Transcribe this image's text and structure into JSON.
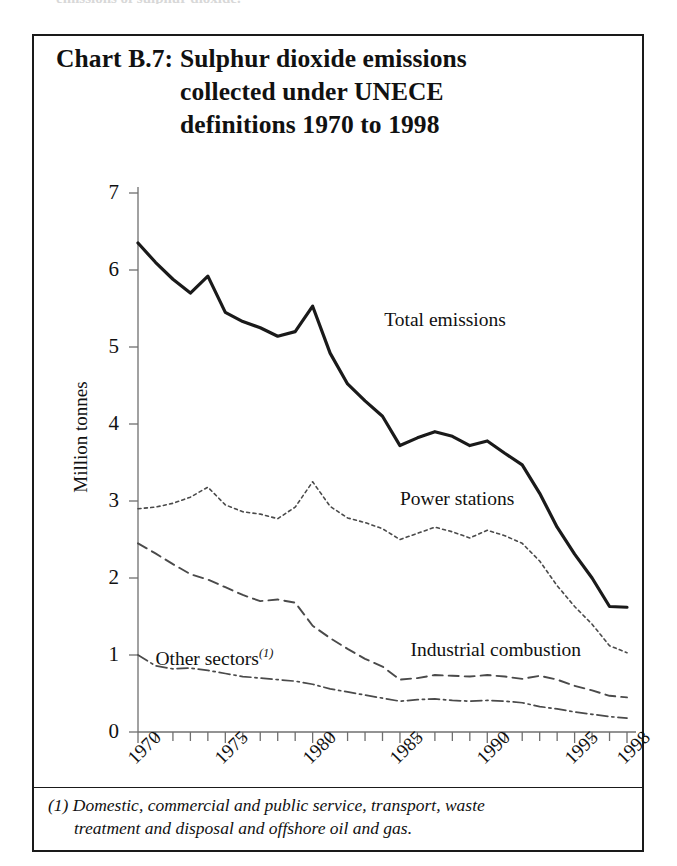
{
  "page": {
    "top_bleed_text": "emissions of sulphur dioxide."
  },
  "chart_box": {
    "title_label": "Chart B.7:",
    "title_lines": [
      "Sulphur dioxide emissions",
      "collected under UNECE",
      "definitions 1970 to 1998"
    ],
    "footnote_line1": "(1) Domestic, commercial and public service, transport, waste",
    "footnote_line2": "treatment and disposal and offshore oil and gas."
  },
  "colors": {
    "ink": "#1a1a1a",
    "axis": "#6f6f6f",
    "total_series": "#1a1a1a",
    "power_series": "#4a4a4a",
    "industrial_series": "#4a4a4a",
    "other_series": "#4a4a4a",
    "background": "#ffffff"
  },
  "chart_data": {
    "type": "line",
    "title": "Chart B.7: Sulphur dioxide emissions collected under UNECE definitions 1970 to 1998",
    "xlabel": "",
    "ylabel": "Million tonnes",
    "xlim": [
      1970,
      1998
    ],
    "ylim": [
      0,
      7
    ],
    "y_ticks": [
      0,
      1,
      2,
      3,
      4,
      5,
      6,
      7
    ],
    "y_tick_labels": [
      "0",
      "1",
      "2",
      "3",
      "4",
      "5",
      "6",
      "7"
    ],
    "x_ticks": [
      1970,
      1975,
      1980,
      1985,
      1990,
      1995,
      1998
    ],
    "x_tick_labels": [
      "1970",
      "1975",
      "1980",
      "1985",
      "1990",
      "1995",
      "1998"
    ],
    "x_minor_tick_every": 1,
    "grid": false,
    "legend": "inline-annotations",
    "x": [
      1970,
      1971,
      1972,
      1973,
      1974,
      1975,
      1976,
      1977,
      1978,
      1979,
      1980,
      1981,
      1982,
      1983,
      1984,
      1985,
      1986,
      1987,
      1988,
      1989,
      1990,
      1991,
      1992,
      1993,
      1994,
      1995,
      1996,
      1997,
      1998
    ],
    "series": [
      {
        "name": "Total emissions",
        "style": "solid",
        "width": 3.2,
        "label_x": 1984.1,
        "label_y": 5.35,
        "values": [
          6.35,
          6.1,
          5.88,
          5.7,
          5.92,
          5.45,
          5.33,
          5.25,
          5.14,
          5.2,
          5.53,
          4.92,
          4.52,
          4.3,
          4.1,
          3.72,
          3.82,
          3.9,
          3.84,
          3.72,
          3.78,
          3.62,
          3.47,
          3.1,
          2.66,
          2.31,
          2.0,
          1.63,
          1.62
        ]
      },
      {
        "name": "Power stations",
        "style": "dotted",
        "width": 1.6,
        "label_x": 1985.0,
        "label_y": 3.02,
        "values": [
          2.9,
          2.92,
          2.97,
          3.05,
          3.18,
          2.95,
          2.86,
          2.83,
          2.77,
          2.92,
          3.25,
          2.93,
          2.78,
          2.72,
          2.64,
          2.5,
          2.58,
          2.66,
          2.6,
          2.52,
          2.62,
          2.55,
          2.45,
          2.22,
          1.9,
          1.63,
          1.4,
          1.12,
          1.03
        ]
      },
      {
        "name": "Industrial combustion",
        "style": "dashed",
        "width": 1.9,
        "label_x": 1985.6,
        "label_y": 1.07,
        "values": [
          2.45,
          2.32,
          2.18,
          2.05,
          1.98,
          1.88,
          1.78,
          1.7,
          1.72,
          1.68,
          1.38,
          1.22,
          1.08,
          0.95,
          0.85,
          0.68,
          0.7,
          0.74,
          0.73,
          0.72,
          0.74,
          0.72,
          0.69,
          0.73,
          0.68,
          0.6,
          0.54,
          0.47,
          0.45
        ]
      },
      {
        "name": "Other sectors",
        "style": "dashdot",
        "width": 1.7,
        "superscript": "(1)",
        "label_x": 1971.0,
        "label_y": 1.02,
        "values": [
          1.0,
          0.86,
          0.82,
          0.83,
          0.8,
          0.76,
          0.72,
          0.7,
          0.68,
          0.66,
          0.62,
          0.56,
          0.52,
          0.48,
          0.44,
          0.4,
          0.42,
          0.43,
          0.41,
          0.4,
          0.41,
          0.4,
          0.38,
          0.33,
          0.3,
          0.26,
          0.23,
          0.2,
          0.18
        ]
      }
    ]
  }
}
